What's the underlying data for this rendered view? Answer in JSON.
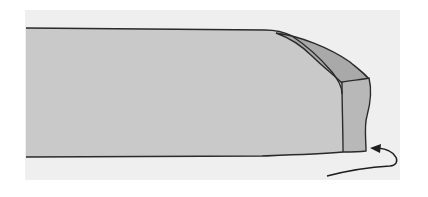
{
  "diagram": {
    "colors": {
      "background": "#ffffff",
      "panel": "#efefef",
      "body_fill": "#c9c9c9",
      "fold_fill": "#a9a9a9",
      "end_fill": "#b8b8b8",
      "outline": "#2a2a2a"
    },
    "elements": [
      {
        "name": "strip-body",
        "label": ""
      },
      {
        "name": "folded-flap",
        "label": ""
      },
      {
        "name": "folded-end-face",
        "label": ""
      },
      {
        "name": "fold-direction-arrow",
        "label": ""
      }
    ]
  }
}
